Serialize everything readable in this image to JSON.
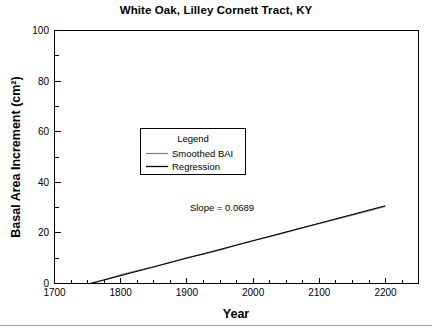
{
  "chart_data": {
    "type": "line",
    "title": "White Oak, Lilley Cornett Tract, KY",
    "xlabel": "Year",
    "ylabel": "Basal Area Increment (cm²)",
    "xlim": [
      1700,
      2250
    ],
    "ylim": [
      0,
      100
    ],
    "grid": false,
    "xticks": [
      1700,
      1800,
      1900,
      2000,
      2100,
      2200
    ],
    "xtick_labels": [
      "1700",
      "1800",
      "1900",
      "2000",
      "2100",
      "2200"
    ],
    "xminor_interval": 25,
    "yticks": [
      0,
      20,
      40,
      60,
      80,
      100
    ],
    "ytick_labels": [
      "0",
      "20",
      "40",
      "60",
      "80",
      "100"
    ],
    "yminor_interval": 10,
    "legend": {
      "title": "Legend",
      "position": "upper-center-left",
      "entries": [
        {
          "name": "Smoothed BAI",
          "color": "#808080"
        },
        {
          "name": "Regression",
          "color": "#000000"
        }
      ]
    },
    "annotations": [
      {
        "text": "Slope = 0.0689",
        "x": 2010,
        "y": 26
      }
    ],
    "series": [
      {
        "name": "Smoothed BAI",
        "color": "#808080",
        "x": [
          1755,
          1775,
          1800,
          1825,
          1850,
          1875,
          1900,
          1925,
          1950,
          1975,
          2000,
          2025,
          2050,
          2075,
          2100,
          2125,
          2150,
          2175,
          2200
        ],
        "values": [
          0.2,
          1.5,
          3.4,
          5.1,
          6.6,
          8.4,
          10.3,
          11.6,
          13.2,
          15.1,
          16.9,
          18.5,
          20.2,
          21.9,
          23.6,
          25.3,
          27.0,
          28.7,
          30.4
        ]
      },
      {
        "name": "Regression",
        "color": "#000000",
        "slope": 0.0689,
        "x": [
          1755,
          2200
        ],
        "values": [
          0.0,
          30.7
        ]
      }
    ]
  },
  "figure": {
    "background": "#ffffff",
    "footer_rule_color": "#9a9a9a"
  }
}
